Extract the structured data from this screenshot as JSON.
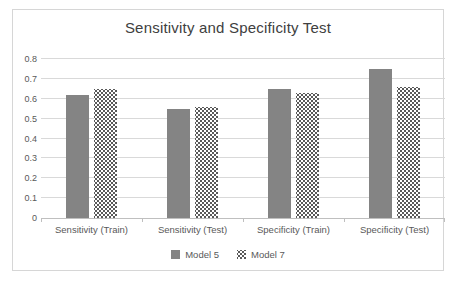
{
  "chart_data": {
    "type": "bar",
    "title": "Sensitivity and Specificity Test",
    "categories": [
      "Sensitivity (Train)",
      "Sensitivity (Test)",
      "Specificity (Train)",
      "Specificity (Test)"
    ],
    "series": [
      {
        "name": "Model 5",
        "style": "solid",
        "color": "#848484",
        "values": [
          0.62,
          0.55,
          0.65,
          0.75
        ]
      },
      {
        "name": "Model 7",
        "style": "dotted",
        "color": "#595959",
        "pattern_bg": "#ffffff",
        "values": [
          0.65,
          0.56,
          0.63,
          0.66
        ]
      }
    ],
    "xlabel": "",
    "ylabel": "",
    "ylim": [
      0,
      0.8
    ],
    "ytick_step": 0.1,
    "ytick_labels": [
      "0",
      "0.1",
      "0.2",
      "0.3",
      "0.4",
      "0.5",
      "0.6",
      "0.7",
      "0.8"
    ],
    "grid": true,
    "gridline_color": "#d9d9d9",
    "axis_color": "#bfbfbf",
    "title_color": "#404040",
    "label_color": "#595959",
    "legend_position": "bottom"
  }
}
